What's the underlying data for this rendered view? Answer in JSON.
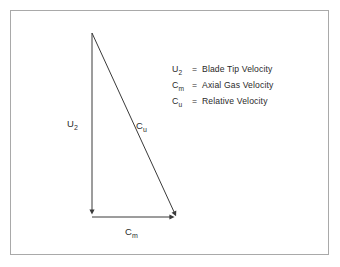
{
  "figure": {
    "border_color": "#a9a9a9",
    "stroke_color": "#3a3a3a",
    "background": "#ffffff"
  },
  "diagram": {
    "type": "velocity-triangle",
    "vectors": [
      {
        "id": "u2",
        "symbol": "U",
        "subscript": "2",
        "from": [
          92,
          33
        ],
        "to": [
          92,
          217
        ],
        "arrowhead": "end",
        "label_x": 67,
        "label_y": 118
      },
      {
        "id": "cm",
        "symbol": "C",
        "subscript": "m",
        "from": [
          92,
          217
        ],
        "to": [
          178,
          217
        ],
        "arrowhead": "end",
        "label_x": 125,
        "label_y": 226
      },
      {
        "id": "cu",
        "symbol": "C",
        "subscript": "u",
        "from": [
          92,
          33
        ],
        "to": [
          178,
          217
        ],
        "arrowhead": "end",
        "label_x": 136,
        "label_y": 120
      }
    ]
  },
  "legend": {
    "separator": "=",
    "items": [
      {
        "symbol": "U",
        "subscript": "2",
        "description": "Blade Tip Velocity"
      },
      {
        "symbol": "C",
        "subscript": "m",
        "description": "Axial Gas Velocity"
      },
      {
        "symbol": "C",
        "subscript": "u",
        "description": "Relative Velocity"
      }
    ]
  }
}
